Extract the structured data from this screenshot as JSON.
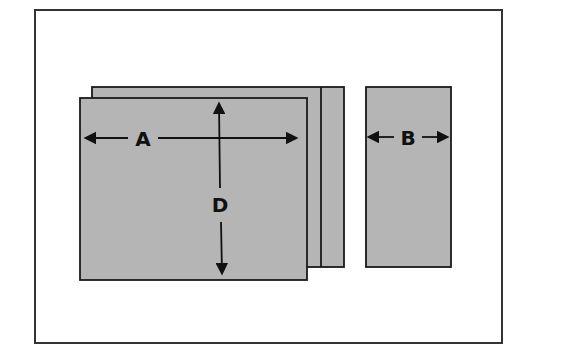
{
  "diagram": {
    "panel_color": "#b5b5b5",
    "stroke_color": "#1a1a1a",
    "labels": {
      "width": "A",
      "depth": "D",
      "side_width": "B"
    }
  }
}
